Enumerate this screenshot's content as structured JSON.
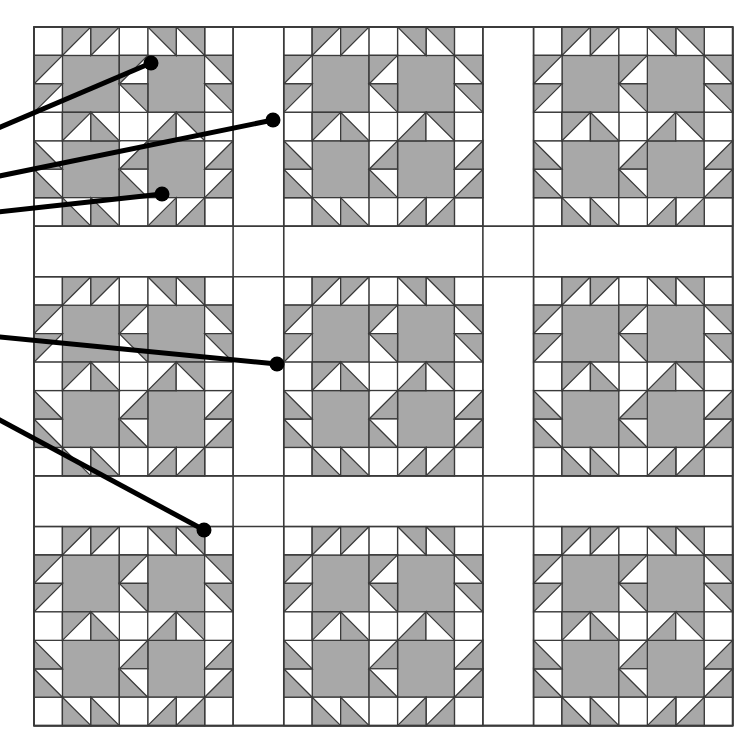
{
  "figure": {
    "kind": "quilt-pattern-diagram",
    "canvas": {
      "width": 737,
      "height": 737
    },
    "background_color": "#ffffff"
  },
  "palette": {
    "fabric_light": "#ffffff",
    "fabric_medium": "#a8a8a8",
    "patch_outline": "#3a3a3a",
    "leader_line": "#000000",
    "leader_dot": "#000000"
  },
  "quilt": {
    "origin_x": 34,
    "origin_y": 27,
    "unit": 36.2,
    "units_across": 18.5,
    "units_down": 18.6,
    "block_rows": 3,
    "block_cols": 3,
    "block_units": 5.5,
    "sashing_units": 1.4,
    "outline_width": 1.6,
    "blocks": [
      {
        "row": 0,
        "col": 0,
        "name": "bears-paw-block-r0c0"
      },
      {
        "row": 0,
        "col": 1,
        "name": "bears-paw-block-r0c1"
      },
      {
        "row": 0,
        "col": 2,
        "name": "bears-paw-block-r0c2"
      },
      {
        "row": 1,
        "col": 0,
        "name": "bears-paw-block-r1c0"
      },
      {
        "row": 1,
        "col": 1,
        "name": "bears-paw-block-r1c1"
      },
      {
        "row": 1,
        "col": 2,
        "name": "bears-paw-block-r1c2"
      },
      {
        "row": 2,
        "col": 0,
        "name": "bears-paw-block-r2c0"
      },
      {
        "row": 2,
        "col": 1,
        "name": "bears-paw-block-r2c1"
      },
      {
        "row": 2,
        "col": 2,
        "name": "bears-paw-block-r2c2"
      }
    ]
  },
  "annotations": {
    "line_width": 5,
    "dot_radius": 7.5,
    "leaders": [
      {
        "id": "leader-1",
        "x1": -30,
        "y1": 140,
        "x2": 151,
        "y2": 63
      },
      {
        "id": "leader-2",
        "x1": -30,
        "y1": 182,
        "x2": 273,
        "y2": 120
      },
      {
        "id": "leader-3",
        "x1": -30,
        "y1": 215,
        "x2": 162,
        "y2": 194
      },
      {
        "id": "leader-4",
        "x1": -30,
        "y1": 334,
        "x2": 277,
        "y2": 364
      },
      {
        "id": "leader-5",
        "x1": -30,
        "y1": 404,
        "x2": 204,
        "y2": 530
      }
    ]
  },
  "chart_data": {
    "type": "table",
    "xlabel": "",
    "ylabel": "",
    "categories": [
      "block-row-0",
      "block-row-1",
      "block-row-2"
    ],
    "series": [
      {
        "name": "blocks-per-row",
        "values": [
          3,
          3,
          3
        ]
      },
      {
        "name": "paws-per-block",
        "values": [
          4,
          4,
          4
        ]
      },
      {
        "name": "half-square-triangles-per-block",
        "values": [
          20,
          20,
          20
        ]
      }
    ],
    "legend": [
      {
        "label": "light fabric",
        "color": "#ffffff"
      },
      {
        "label": "medium fabric",
        "color": "#a8a8a8"
      }
    ],
    "grid": true,
    "legend_position": "none"
  }
}
